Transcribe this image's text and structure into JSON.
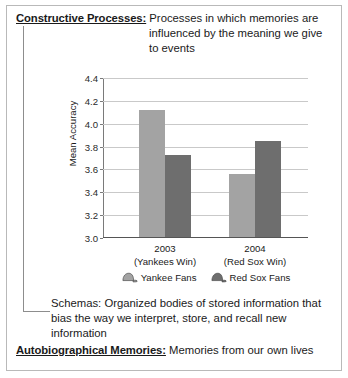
{
  "entries": [
    {
      "term": "Constructive Processes:",
      "definition": "Processes in which memories are influenced by the meaning we give to events"
    },
    {
      "term": "Schemas:",
      "definition": "Organized bodies of stored information that bias the way we interpret, store, and recall new information"
    },
    {
      "term": "Autobiographical Memories:",
      "definition": "Memories from our own lives"
    }
  ],
  "chart_data": {
    "type": "bar",
    "title": "",
    "xlabel": "",
    "ylabel": "Mean Accuracy",
    "ylim": [
      3.0,
      4.4
    ],
    "yticks": [
      "3.0",
      "3.2",
      "3.4",
      "3.6",
      "3.8",
      "4.0",
      "4.2",
      "4.4"
    ],
    "grid": true,
    "legend_position": "bottom",
    "categories": [
      "2003",
      "2004"
    ],
    "category_sublabels": [
      "(Yankees Win)",
      "(Red Sox Win)"
    ],
    "series": [
      {
        "name": "Yankee Fans",
        "color": "#a3a3a3",
        "icon": "baseball-cap-icon",
        "values": [
          4.11,
          3.55
        ]
      },
      {
        "name": "Red Sox Fans",
        "color": "#6e6e6e",
        "icon": "baseball-cap-icon",
        "values": [
          3.72,
          3.84
        ]
      }
    ]
  }
}
